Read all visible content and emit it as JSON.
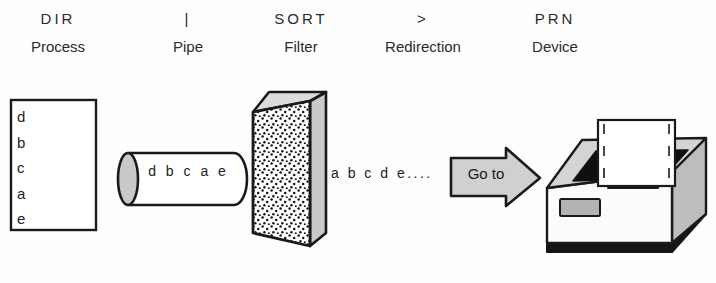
{
  "diagram": {
    "background_color": "#fefefe",
    "ink_color": "#1a1a1a",
    "fill_gray": "#c9c9c9",
    "stages": [
      {
        "symbol": "DIR",
        "role": "Process"
      },
      {
        "symbol": "|",
        "role": "Pipe"
      },
      {
        "symbol": "SORT",
        "role": "Filter"
      },
      {
        "symbol": ">",
        "role": "Redirection"
      },
      {
        "symbol": "PRN",
        "role": "Device"
      }
    ],
    "process_box": {
      "lines": [
        "d",
        "b",
        "c",
        "a",
        "e"
      ]
    },
    "pipe": {
      "content": "d b c a e"
    },
    "filter": {
      "name": "sort-filter-slab"
    },
    "redirection": {
      "stream": "a b c d e...."
    },
    "arrow": {
      "label": "Go to"
    },
    "device": {
      "name": "printer"
    }
  }
}
